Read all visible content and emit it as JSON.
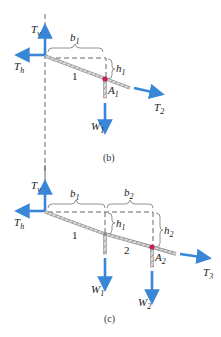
{
  "colors": {
    "force_arrow": "#3a86d6",
    "cable": "#9a9a9a",
    "dashed_line": "#555555",
    "attachment_point": "#c0244f",
    "text": "#222222"
  },
  "panel_b": {
    "caption": "(b)",
    "labels": {
      "Tv": {
        "main": "T",
        "sub": "v"
      },
      "Th": {
        "main": "T",
        "sub": "h"
      },
      "T2": {
        "main": "T",
        "sub": "2"
      },
      "W1": {
        "main": "W",
        "sub": "1"
      },
      "A1": {
        "main": "A",
        "sub": "1"
      },
      "b1": {
        "main": "b",
        "sub": "1"
      },
      "h1": {
        "main": "h",
        "sub": "1"
      },
      "segment1": "1"
    }
  },
  "panel_c": {
    "caption": "(c)",
    "labels": {
      "Tv": {
        "main": "T",
        "sub": "v"
      },
      "Th": {
        "main": "T",
        "sub": "h"
      },
      "T3": {
        "main": "T",
        "sub": "3"
      },
      "W1": {
        "main": "W",
        "sub": "1"
      },
      "W2": {
        "main": "W",
        "sub": "2"
      },
      "A2": {
        "main": "A",
        "sub": "2"
      },
      "b1": {
        "main": "b",
        "sub": "1"
      },
      "b2": {
        "main": "b",
        "sub": "2"
      },
      "h1": {
        "main": "h",
        "sub": "1"
      },
      "h2": {
        "main": "h",
        "sub": "2"
      },
      "segment1": "1",
      "segment2": "2"
    }
  }
}
